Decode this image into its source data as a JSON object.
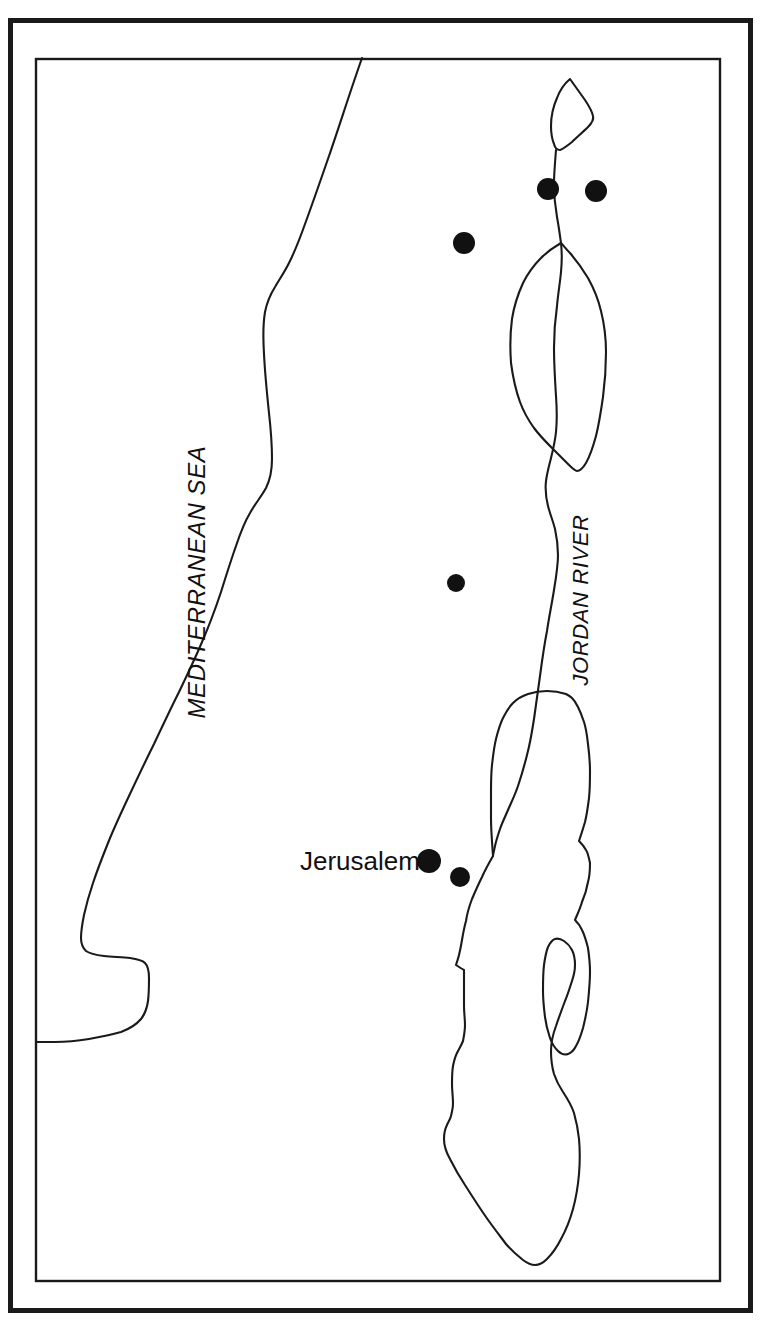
{
  "figure": {
    "kind": "line-map",
    "region": "Ancient Palestine / Levant",
    "background_color": "#ffffff",
    "ink_color": "#1a1a1a",
    "marker_color": "#111111",
    "width": 764,
    "height": 1343
  },
  "frame": {
    "outer": {
      "x": 8,
      "y": 18,
      "width": 743,
      "height": 1293,
      "stroke_width": 5
    },
    "inner": {
      "x": 35,
      "y": 58,
      "width": 685,
      "height": 1223,
      "stroke_width": 2.4
    }
  },
  "labels": [
    {
      "id": "mediterranean-sea",
      "text": "MEDITERRANEAN SEA",
      "x": 205,
      "y": 582,
      "rotation": -90,
      "font_size": 24,
      "style": "italic",
      "case": "upper"
    },
    {
      "id": "jordan-river",
      "text": "JORDAN RIVER",
      "x": 588,
      "y": 702,
      "rotation": -90,
      "font_size": 22,
      "style": "italic",
      "case": "upper"
    },
    {
      "id": "jerusalem",
      "text": "Jerusalem",
      "x": 300,
      "y": 867,
      "rotation": 0,
      "font_size": 26,
      "style": "normal",
      "case": "mixed"
    }
  ],
  "city_markers": [
    {
      "id": "site-1",
      "cx": 548,
      "cy": 189,
      "r": 11
    },
    {
      "id": "site-2",
      "cx": 596,
      "cy": 191,
      "r": 11
    },
    {
      "id": "site-3",
      "cx": 464,
      "cy": 243,
      "r": 11
    },
    {
      "id": "site-4",
      "cx": 456,
      "cy": 583,
      "r": 9
    },
    {
      "id": "site-5",
      "cx": 429,
      "cy": 861,
      "r": 12
    },
    {
      "id": "site-6",
      "cx": 460,
      "cy": 877,
      "r": 10
    }
  ],
  "features": {
    "coastline": {
      "name": "Mediterranean coastline",
      "path": "M 362 58 C 348 96, 336 132, 323 168 C 314 193, 306 214, 300 232 C 295 248, 292 258, 289 268 C 285 278, 281 284, 277 289 C 272 295, 268 300, 266 309 C 263 320, 263 335, 263 352 C 263 372, 264 392, 266 412 C 268 432, 270 448, 270 462 C 270 474, 268 482, 264 489 C 259 497, 253 503, 248 511 C 242 520, 238 530, 234 542 C 229 556, 224 572, 219 588 C 213 606, 207 622, 200 638 C 193 655, 185 671, 177 688 C 168 706, 160 723, 152 740 C 143 758, 135 775, 127 792 C 119 809, 112 825, 106 840 C 100 855, 95 868, 91 880 C 87 893, 84 903, 82 913 C 80 923, 79 930, 79 936 C 79 942, 80 946, 83 949 C 87 952, 93 953, 101 954 C 110 955, 120 955, 128 956 C 136 957, 141 958, 144 961 C 147 964, 148 969, 148 976 C 148 984, 148 992, 147 1000 C 146 1007, 144 1013, 140 1018 C 135 1024, 128 1028, 120 1031 C 110 1034, 99 1036, 88 1038 C 76 1040, 64 1041, 54 1041 C 46 1041, 40 1041, 35 1041"
    },
    "lake_huleh": {
      "name": "Lake Huleh",
      "path": "M 570 79 C 575 86, 580 93, 585 100 C 589 106, 592 111, 593 115 C 594 119, 592 122, 588 126 C 583 131, 577 136, 571 141 C 566 145, 562 148, 559 149 C 556 150, 554 148, 553 144 C 551 139, 550 133, 550 126 C 550 117, 552 107, 556 98 C 559 90, 564 84, 570 79 Z"
    },
    "huleh_outflow": {
      "name": "Jordan river, Huleh to Galilee",
      "path": "M 556 149 C 554 162, 553 172, 553 180 C 553 192, 554 202, 556 212"
    },
    "sea_of_galilee": {
      "name": "Sea of Galilee",
      "path": "M 566 205 C 559 209, 552 214, 546 220 C 539 227, 533 235, 528 245 C 523 255, 520 267, 518 280 C 516 295, 516 310, 517 324 C 518 338, 521 350, 524 360 C 528 370, 532 376, 537 381 C 541 386, 546 388, 551 389 C 556 390, 560 389, 564 386 C 568 383, 571 379, 573 373 C 576 366, 578 357, 580 347 C 583 333, 586 318, 589 303 C 592 288, 594 273, 594 259 C 594 247, 592 237, 588 228 C 584 219, 578 212, 571 207 C 569 206, 567 205, 566 205 Z"
    },
    "jordan_river": {
      "name": "Jordan River main course",
      "path": "M 553 180 C 553 192, 554 202, 556 212 C 558 222, 560 232, 561 243 C 562 256, 561 268, 559 280 C 557 293, 554 306, 553 320 C 551 334, 551 348, 551 362 C 551 378, 552 394, 553 410 C 554 424, 554 436, 553 446 C 552 456, 550 464, 548 471 C 546 479, 544 486, 543 494 C 542 503, 543 511, 545 518 C 547 526, 550 533, 552 541 C 554 549, 555 557, 555 566 C 555 577, 553 588, 551 600 C 549 613, 546 627, 544 641 C 541 656, 539 671, 537 686 C 535 701, 533 715, 531 729 C 529 742, 527 754, 524 765 C 521 777, 518 787, 515 796 C 512 805, 508 813, 505 820 C 502 827, 499 833, 497 839 C 495 845, 494 850, 493 855"
    },
    "dead_sea": {
      "name": "Dead Sea with Lisan Peninsula",
      "path": "M 493 855 C 489 862, 485 869, 481 876 C 477 884, 474 891, 471 898 C 468 906, 466 913, 464 920 C 462 927, 461 934, 460 940 C 459 946, 458 951, 457 955 C 456 960, 454 963, 452 966 C 450 970, 477 966, 475 970 C 473 974, 472 979, 471 985 C 470 992, 470 999, 470 1006 C 470 1013, 471 1019, 471 1025 C 471 1031, 470 1036, 469 1040 C 467 1045, 464 1048, 462 1052 C 460 1056, 459 1060, 458 1065 C 457 1071, 457 1077, 457 1083 C 457 1090, 458 1096, 458 1102 C 458 1107, 457 1112, 456 1115 C 455 1119, 453 1121, 452 1124 C 450 1128, 449 1133, 449 1138 C 449 1144, 451 1150, 454 1157 C 458 1165, 463 1174, 469 1183 C 476 1194, 483 1205, 490 1215 C 497 1225, 504 1234, 510 1242 C 516 1249, 521 1254, 526 1258 C 530 1261, 534 1263, 537 1263 C 541 1263, 545 1261, 549 1257 C 554 1252, 559 1245, 563 1237 C 568 1228, 572 1218, 575 1207 C 578 1196, 580 1184, 581 1172 C 582 1160, 582 1148, 581 1137 C 580 1127, 578 1118, 576 1111 C 573 1102, 569 1096, 566 1090 C 562 1084, 559 1078, 557 1072 C 555 1065, 554 1058, 554 1050 C 554 1042, 556 1033, 558 1025 C 561 1016, 564 1008, 567 1000 C 570 993, 572 986, 574 980 C 576 974, 576 969, 576 964 C 576 958, 575 953, 573 949 C 571 945, 568 942, 565 940 C 562 938, 559 937, 556 938 C 553 939, 551 942, 549 946 C 547 951, 546 957, 545 964 C 544 972, 544 981, 544 990 C 544 999, 545 1008, 546 1016 C 547 1024, 549 1031, 551 1037 C 553 1043, 556 1047, 559 1050 C 562 1053, 566 1054, 569 1053 C 572 1052, 575 1049, 577 1045 C 580 1040, 582 1034, 584 1027 C 586 1019, 588 1010, 589 1001 C 590 991, 591 981, 591 971 C 591 962, 590 954, 589 947 C 587 939, 585 933, 583 929 C 581 924, 578 921, 576 919 C 578 914, 581 908, 583 901 C 586 894, 588 887, 589 881 C 591 874, 591 868, 591 862 C 590 857, 589 852, 587 849 C 585 845, 582 842, 580 840 C 582 834, 584 828, 586 821 C 588 813, 589 805, 590 797 C 591 788, 591 779, 591 770 C 591 760, 590 751, 589 743 C 588 734, 587 727, 585 721 C 583 715, 581 710, 579 706 C 577 702, 575 699, 573 697 C 571 695, 569 694, 567 693 C 561 691, 554 690, 548 690 C 541 690, 535 691, 529 693 C 523 695, 518 698, 514 702 C 510 706, 507 711, 504 717 C 501 723, 499 730, 497 738 C 495 746, 494 755, 493 764 C 492 773, 492 782, 492 791 C 492 800, 492 809, 492 818 C 492 829, 492 840, 493 855 Z"
    },
    "dead_sea_lower": {
      "name": "Dead Sea southern basin outline",
      "path": ""
    }
  }
}
